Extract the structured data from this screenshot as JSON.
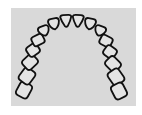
{
  "diagram": {
    "title": "",
    "type": "dental-arch",
    "background_color": "#d9d9d9",
    "stroke_color": "#111111",
    "fill_color": "#e4e4e4",
    "teeth_count": 16,
    "teeth": [
      {
        "side": "left",
        "index": 8,
        "shape": "molar",
        "cx": 24,
        "cy": 90,
        "w": 15,
        "h": 13
      },
      {
        "side": "left",
        "index": 7,
        "shape": "molar",
        "cx": 27,
        "cy": 76,
        "w": 15,
        "h": 13
      },
      {
        "side": "left",
        "index": 6,
        "shape": "molar",
        "cx": 30,
        "cy": 62,
        "w": 14,
        "h": 12
      },
      {
        "side": "left",
        "index": 5,
        "shape": "premolar",
        "cx": 33,
        "cy": 50,
        "w": 12,
        "h": 11
      },
      {
        "side": "left",
        "index": 4,
        "shape": "premolar",
        "cx": 38,
        "cy": 40,
        "w": 12,
        "h": 10
      },
      {
        "side": "left",
        "index": 3,
        "shape": "canine",
        "cx": 44,
        "cy": 31,
        "w": 11,
        "h": 10
      },
      {
        "side": "left",
        "index": 2,
        "shape": "incisor",
        "cx": 54,
        "cy": 24,
        "w": 11,
        "h": 11
      },
      {
        "side": "left",
        "index": 1,
        "shape": "incisor",
        "cx": 66,
        "cy": 21,
        "w": 11,
        "h": 12
      },
      {
        "side": "right",
        "index": 1,
        "shape": "incisor",
        "cx": 78,
        "cy": 21,
        "w": 11,
        "h": 12
      },
      {
        "side": "right",
        "index": 2,
        "shape": "incisor",
        "cx": 90,
        "cy": 24,
        "w": 11,
        "h": 11
      },
      {
        "side": "right",
        "index": 3,
        "shape": "canine",
        "cx": 100,
        "cy": 31,
        "w": 11,
        "h": 10
      },
      {
        "side": "right",
        "index": 4,
        "shape": "premolar",
        "cx": 106,
        "cy": 41,
        "w": 12,
        "h": 10
      },
      {
        "side": "right",
        "index": 5,
        "shape": "premolar",
        "cx": 110,
        "cy": 52,
        "w": 12,
        "h": 11
      },
      {
        "side": "right",
        "index": 6,
        "shape": "molar",
        "cx": 113,
        "cy": 64,
        "w": 14,
        "h": 12
      },
      {
        "side": "right",
        "index": 7,
        "shape": "molar",
        "cx": 116,
        "cy": 77,
        "w": 15,
        "h": 13
      },
      {
        "side": "right",
        "index": 8,
        "shape": "molar",
        "cx": 119,
        "cy": 91,
        "w": 15,
        "h": 13
      }
    ]
  }
}
